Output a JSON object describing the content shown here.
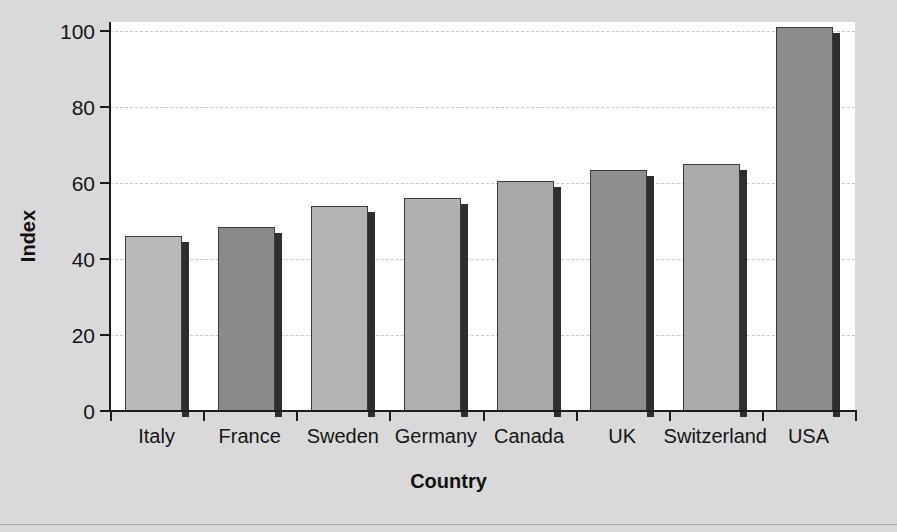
{
  "chart_data": {
    "type": "bar",
    "title": "",
    "xlabel": "Country",
    "ylabel": "Index",
    "categories": [
      "Italy",
      "France",
      "Sweden",
      "Germany",
      "Canada",
      "UK",
      "Switzerland",
      "USA"
    ],
    "values": [
      46,
      48.5,
      54,
      56,
      60.5,
      63.5,
      65,
      101
    ],
    "bar_colors": [
      "#b9b9b9",
      "#8a8a8a",
      "#b3b3b3",
      "#b0b0b0",
      "#a8a8a8",
      "#8e8e8e",
      "#ababab",
      "#8d8d8d"
    ],
    "ylim": [
      0,
      100
    ],
    "yticks": [
      0,
      20,
      40,
      60,
      80,
      100
    ],
    "ytick_labels": [
      "0",
      "20",
      "40",
      "60",
      "80",
      "100"
    ],
    "grid": true,
    "grid_axis": "y",
    "legend": "none",
    "xlim_note": "categorical"
  },
  "figure": {
    "background_color": "#d9d9d9",
    "plot_background_color": "#ffffff",
    "axis_color": "#1c1c1c",
    "gridline_color": "#c9c9c9",
    "shadow_color": "#2e2e2e"
  }
}
